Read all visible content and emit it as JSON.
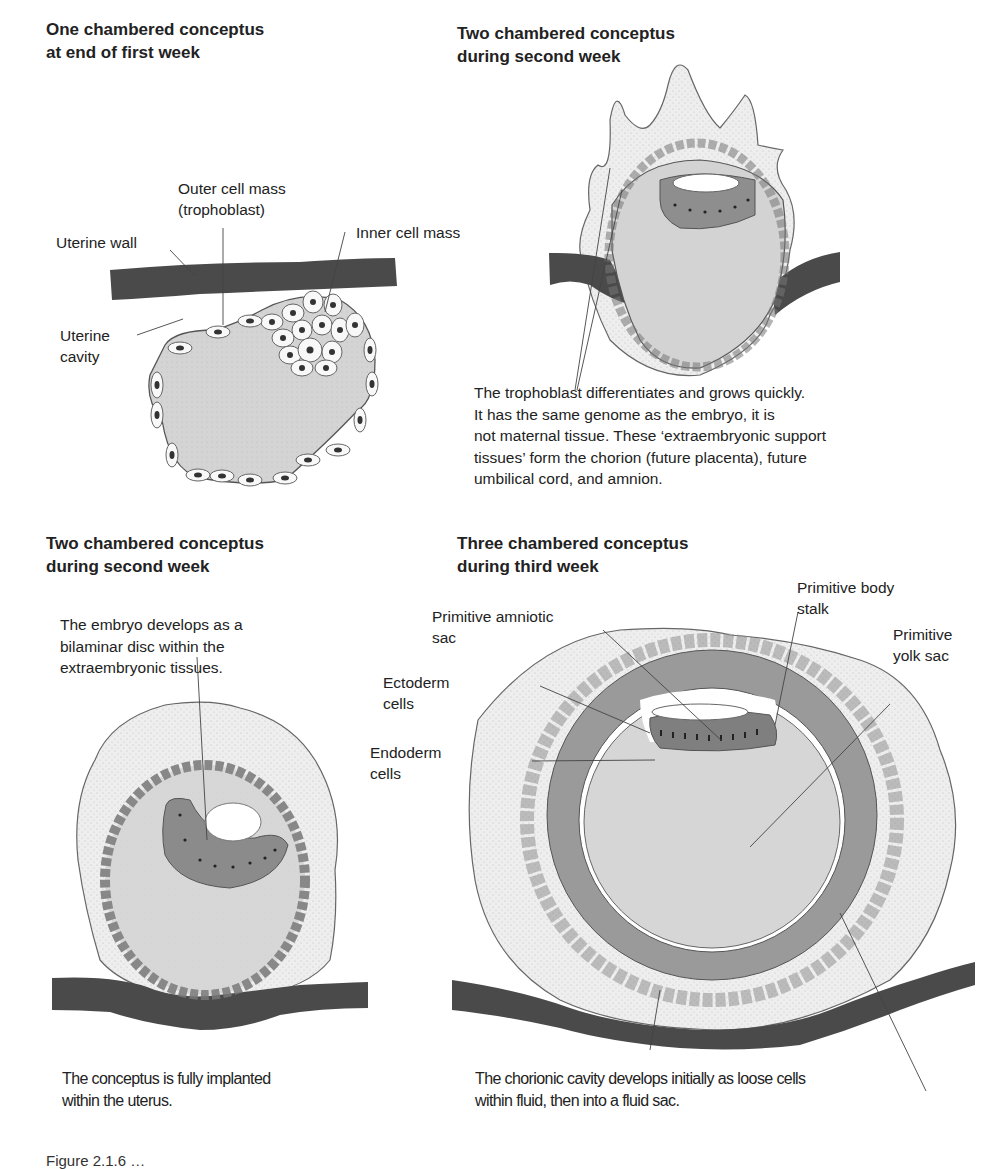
{
  "panels": {
    "top_left": {
      "title_line1": "One chambered conceptus",
      "title_line2": "at end of first week",
      "labels": {
        "outer_cell_mass_1": "Outer cell mass",
        "outer_cell_mass_2": "(trophoblast)",
        "inner_cell_mass": "Inner cell mass",
        "uterine_wall": "Uterine wall",
        "uterine_cavity_1": "Uterine",
        "uterine_cavity_2": "cavity"
      }
    },
    "top_right": {
      "title_line1": "Two chambered conceptus",
      "title_line2": "during second week",
      "description": [
        "The trophoblast differentiates and grows quickly.",
        "It has the same genome as the embryo, it is",
        "not maternal tissue. These ‘extraembryonic support",
        "tissues’ form the chorion (future placenta), future",
        "umbilical cord, and amnion."
      ]
    },
    "bottom_left": {
      "title_line1": "Two chambered conceptus",
      "title_line2": "during second week",
      "description": [
        "The embryo develops as a",
        "bilaminar disc within the",
        "extraembryonic tissues."
      ],
      "footer": [
        "The conceptus is fully implanted",
        "within the uterus."
      ]
    },
    "bottom_right": {
      "title_line1": "Three chambered conceptus",
      "title_line2": "during third week",
      "labels": {
        "primitive_body_stalk_1": "Primitive body",
        "primitive_body_stalk_2": "stalk",
        "primitive_amniotic_sac_1": "Primitive amniotic",
        "primitive_amniotic_sac_2": "sac",
        "primitive_yolk_sac_1": "Primitive",
        "primitive_yolk_sac_2": "yolk sac",
        "ectoderm_1": "Ectoderm",
        "ectoderm_2": "cells",
        "endoderm_1": "Endoderm",
        "endoderm_2": "cells"
      },
      "footer": [
        "The chorionic cavity develops initially as loose cells",
        "within fluid, then into a fluid sac."
      ]
    }
  },
  "caption_truncated": "Figure 2.1.6 …",
  "colors": {
    "uterine_wall": "#4a4a4a",
    "trophoblast_stipple": "#ececec",
    "cavity_fill": "#d2d2d2",
    "disc_fill": "#8a8a8a",
    "chorion_band": "#9a9a9a",
    "cell_fill": "#f8f8f8",
    "nucleus": "#333333",
    "outline": "#555555"
  }
}
